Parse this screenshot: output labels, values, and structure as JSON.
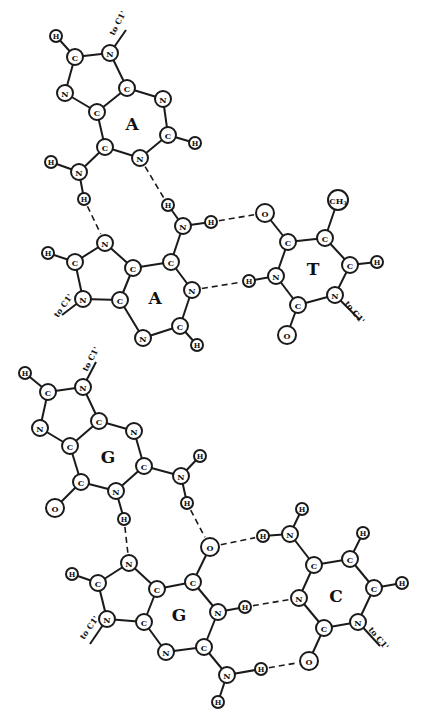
{
  "diagram": {
    "triples": [
      {
        "name": "A-A-T triple",
        "bases": [
          {
            "label": "A",
            "role": "hoogsteen-adenine"
          },
          {
            "label": "A",
            "role": "watson-crick-adenine"
          },
          {
            "label": "T",
            "role": "thymine"
          }
        ]
      },
      {
        "name": "G-G-C triple",
        "bases": [
          {
            "label": "G",
            "role": "hoogsteen-guanine"
          },
          {
            "label": "G",
            "role": "watson-crick-guanine"
          },
          {
            "label": "C",
            "role": "cytosine"
          }
        ]
      }
    ],
    "sugar_link_label": "to C1'",
    "atoms": [
      {
        "id": "a1_h8",
        "el": "H",
        "x": 56,
        "y": 36
      },
      {
        "id": "a1_c8",
        "el": "C",
        "x": 75,
        "y": 57
      },
      {
        "id": "a1_n9",
        "el": "N",
        "x": 110,
        "y": 53
      },
      {
        "id": "a1_n7",
        "el": "N",
        "x": 65,
        "y": 93
      },
      {
        "id": "a1_c5",
        "el": "C",
        "x": 97,
        "y": 112
      },
      {
        "id": "a1_c4",
        "el": "C",
        "x": 127,
        "y": 88
      },
      {
        "id": "a1_n3",
        "el": "N",
        "x": 163,
        "y": 99
      },
      {
        "id": "a1_c2",
        "el": "C",
        "x": 168,
        "y": 135
      },
      {
        "id": "a1_h2",
        "el": "H",
        "x": 195,
        "y": 143
      },
      {
        "id": "a1_c6",
        "el": "C",
        "x": 105,
        "y": 147
      },
      {
        "id": "a1_n1",
        "el": "N",
        "x": 140,
        "y": 158
      },
      {
        "id": "a1_n6",
        "el": "N",
        "x": 79,
        "y": 172
      },
      {
        "id": "a1_h6a",
        "el": "H",
        "x": 51,
        "y": 162
      },
      {
        "id": "a1_h6b",
        "el": "H",
        "x": 84,
        "y": 199
      },
      {
        "id": "a2_n7",
        "el": "N",
        "x": 105,
        "y": 243
      },
      {
        "id": "a2_c8",
        "el": "C",
        "x": 75,
        "y": 262
      },
      {
        "id": "a2_h8",
        "el": "H",
        "x": 48,
        "y": 253
      },
      {
        "id": "a2_n9",
        "el": "N",
        "x": 83,
        "y": 299
      },
      {
        "id": "a2_c4",
        "el": "C",
        "x": 120,
        "y": 300
      },
      {
        "id": "a2_c5",
        "el": "C",
        "x": 133,
        "y": 268
      },
      {
        "id": "a2_c6",
        "el": "C",
        "x": 171,
        "y": 262
      },
      {
        "id": "a2_n6",
        "el": "N",
        "x": 183,
        "y": 226
      },
      {
        "id": "a2_h6a",
        "el": "H",
        "x": 168,
        "y": 205
      },
      {
        "id": "a2_h6b",
        "el": "H",
        "x": 211,
        "y": 222
      },
      {
        "id": "a2_n1",
        "el": "N",
        "x": 192,
        "y": 290
      },
      {
        "id": "a2_c2",
        "el": "C",
        "x": 180,
        "y": 326
      },
      {
        "id": "a2_h2",
        "el": "H",
        "x": 197,
        "y": 345
      },
      {
        "id": "a2_n3",
        "el": "N",
        "x": 143,
        "y": 338
      },
      {
        "id": "t_o4",
        "el": "O",
        "x": 265,
        "y": 213
      },
      {
        "id": "t_c4",
        "el": "C",
        "x": 288,
        "y": 242
      },
      {
        "id": "t_c5",
        "el": "C",
        "x": 325,
        "y": 238
      },
      {
        "id": "t_ch3",
        "el": "CH3",
        "x": 338,
        "y": 200
      },
      {
        "id": "t_c6",
        "el": "C",
        "x": 350,
        "y": 265
      },
      {
        "id": "t_h6",
        "el": "H",
        "x": 377,
        "y": 262
      },
      {
        "id": "t_n1",
        "el": "N",
        "x": 335,
        "y": 295
      },
      {
        "id": "t_c2",
        "el": "C",
        "x": 298,
        "y": 305
      },
      {
        "id": "t_o2",
        "el": "O",
        "x": 287,
        "y": 335
      },
      {
        "id": "t_n3",
        "el": "N",
        "x": 276,
        "y": 276
      },
      {
        "id": "t_h3",
        "el": "H",
        "x": 249,
        "y": 281
      },
      {
        "id": "g1_h8",
        "el": "H",
        "x": 25,
        "y": 373
      },
      {
        "id": "g1_c8",
        "el": "C",
        "x": 48,
        "y": 392
      },
      {
        "id": "g1_n9",
        "el": "N",
        "x": 83,
        "y": 387
      },
      {
        "id": "g1_n7",
        "el": "N",
        "x": 40,
        "y": 428
      },
      {
        "id": "g1_c5",
        "el": "C",
        "x": 70,
        "y": 446
      },
      {
        "id": "g1_c4",
        "el": "C",
        "x": 99,
        "y": 421
      },
      {
        "id": "g1_n3",
        "el": "N",
        "x": 134,
        "y": 431
      },
      {
        "id": "g1_c2",
        "el": "C",
        "x": 144,
        "y": 466
      },
      {
        "id": "g1_n2",
        "el": "N",
        "x": 181,
        "y": 476
      },
      {
        "id": "g1_h2a",
        "el": "H",
        "x": 200,
        "y": 456
      },
      {
        "id": "g1_h2b",
        "el": "H",
        "x": 187,
        "y": 503
      },
      {
        "id": "g1_n1",
        "el": "N",
        "x": 116,
        "y": 491
      },
      {
        "id": "g1_h1",
        "el": "H",
        "x": 124,
        "y": 519
      },
      {
        "id": "g1_c6",
        "el": "C",
        "x": 81,
        "y": 482
      },
      {
        "id": "g1_o6",
        "el": "O",
        "x": 55,
        "y": 508
      },
      {
        "id": "g2_n7",
        "el": "N",
        "x": 129,
        "y": 563
      },
      {
        "id": "g2_c8",
        "el": "C",
        "x": 98,
        "y": 583
      },
      {
        "id": "g2_h8",
        "el": "H",
        "x": 72,
        "y": 574
      },
      {
        "id": "g2_n9",
        "el": "N",
        "x": 107,
        "y": 619
      },
      {
        "id": "g2_c4",
        "el": "C",
        "x": 144,
        "y": 622
      },
      {
        "id": "g2_c5",
        "el": "C",
        "x": 157,
        "y": 589
      },
      {
        "id": "g2_c6",
        "el": "C",
        "x": 193,
        "y": 582
      },
      {
        "id": "g2_o6",
        "el": "O",
        "x": 210,
        "y": 547
      },
      {
        "id": "g2_n1",
        "el": "N",
        "x": 218,
        "y": 612
      },
      {
        "id": "g2_h1",
        "el": "H",
        "x": 245,
        "y": 607
      },
      {
        "id": "g2_c2",
        "el": "C",
        "x": 204,
        "y": 647
      },
      {
        "id": "g2_n2",
        "el": "N",
        "x": 227,
        "y": 675
      },
      {
        "id": "g2_h2a",
        "el": "H",
        "x": 261,
        "y": 669
      },
      {
        "id": "g2_h2b",
        "el": "H",
        "x": 218,
        "y": 702
      },
      {
        "id": "g2_n3",
        "el": "N",
        "x": 166,
        "y": 652
      },
      {
        "id": "c_n4",
        "el": "N",
        "x": 290,
        "y": 534
      },
      {
        "id": "c_h4a",
        "el": "H",
        "x": 302,
        "y": 509
      },
      {
        "id": "c_h4b",
        "el": "H",
        "x": 263,
        "y": 536
      },
      {
        "id": "c_c4",
        "el": "C",
        "x": 314,
        "y": 565
      },
      {
        "id": "c_c5",
        "el": "C",
        "x": 350,
        "y": 559
      },
      {
        "id": "c_h5",
        "el": "H",
        "x": 363,
        "y": 533
      },
      {
        "id": "c_c6",
        "el": "C",
        "x": 374,
        "y": 588
      },
      {
        "id": "c_h6",
        "el": "H",
        "x": 402,
        "y": 583
      },
      {
        "id": "c_n1",
        "el": "N",
        "x": 358,
        "y": 622
      },
      {
        "id": "c_c2",
        "el": "C",
        "x": 324,
        "y": 628
      },
      {
        "id": "c_o2",
        "el": "O",
        "x": 309,
        "y": 661
      },
      {
        "id": "c_n3",
        "el": "N",
        "x": 299,
        "y": 598
      }
    ],
    "bonds": [
      [
        "a1_h8",
        "a1_c8"
      ],
      [
        "a1_c8",
        "a1_n9"
      ],
      [
        "a1_c8",
        "a1_n7"
      ],
      [
        "a1_n9",
        "a1_c4"
      ],
      [
        "a1_n7",
        "a1_c5"
      ],
      [
        "a1_c5",
        "a1_c4"
      ],
      [
        "a1_c4",
        "a1_n3"
      ],
      [
        "a1_n3",
        "a1_c2"
      ],
      [
        "a1_c2",
        "a1_h2"
      ],
      [
        "a1_c2",
        "a1_n1"
      ],
      [
        "a1_n1",
        "a1_c6"
      ],
      [
        "a1_c6",
        "a1_c5"
      ],
      [
        "a1_c6",
        "a1_n6"
      ],
      [
        "a1_n6",
        "a1_h6a"
      ],
      [
        "a1_n6",
        "a1_h6b"
      ],
      [
        "a2_n7",
        "a2_c8"
      ],
      [
        "a2_c8",
        "a2_h8"
      ],
      [
        "a2_c8",
        "a2_n9"
      ],
      [
        "a2_n9",
        "a2_c4"
      ],
      [
        "a2_c4",
        "a2_c5"
      ],
      [
        "a2_c5",
        "a2_n7"
      ],
      [
        "a2_c5",
        "a2_c6"
      ],
      [
        "a2_c6",
        "a2_n6"
      ],
      [
        "a2_n6",
        "a2_h6a"
      ],
      [
        "a2_n6",
        "a2_h6b"
      ],
      [
        "a2_c6",
        "a2_n1"
      ],
      [
        "a2_n1",
        "a2_c2"
      ],
      [
        "a2_c2",
        "a2_h2"
      ],
      [
        "a2_c2",
        "a2_n3"
      ],
      [
        "a2_n3",
        "a2_c4"
      ],
      [
        "t_o4",
        "t_c4"
      ],
      [
        "t_c4",
        "t_c5"
      ],
      [
        "t_c5",
        "t_ch3"
      ],
      [
        "t_c5",
        "t_c6"
      ],
      [
        "t_c6",
        "t_h6"
      ],
      [
        "t_c6",
        "t_n1"
      ],
      [
        "t_n1",
        "t_c2"
      ],
      [
        "t_c2",
        "t_o2"
      ],
      [
        "t_c2",
        "t_n3"
      ],
      [
        "t_n3",
        "t_c4"
      ],
      [
        "t_n3",
        "t_h3"
      ],
      [
        "g1_h8",
        "g1_c8"
      ],
      [
        "g1_c8",
        "g1_n9"
      ],
      [
        "g1_c8",
        "g1_n7"
      ],
      [
        "g1_n9",
        "g1_c4"
      ],
      [
        "g1_n7",
        "g1_c5"
      ],
      [
        "g1_c5",
        "g1_c4"
      ],
      [
        "g1_c4",
        "g1_n3"
      ],
      [
        "g1_n3",
        "g1_c2"
      ],
      [
        "g1_c2",
        "g1_n2"
      ],
      [
        "g1_n2",
        "g1_h2a"
      ],
      [
        "g1_n2",
        "g1_h2b"
      ],
      [
        "g1_c2",
        "g1_n1"
      ],
      [
        "g1_n1",
        "g1_h1"
      ],
      [
        "g1_n1",
        "g1_c6"
      ],
      [
        "g1_c6",
        "g1_c5"
      ],
      [
        "g1_c6",
        "g1_o6"
      ],
      [
        "g2_n7",
        "g2_c8"
      ],
      [
        "g2_c8",
        "g2_h8"
      ],
      [
        "g2_c8",
        "g2_n9"
      ],
      [
        "g2_n9",
        "g2_c4"
      ],
      [
        "g2_c4",
        "g2_c5"
      ],
      [
        "g2_c5",
        "g2_n7"
      ],
      [
        "g2_c5",
        "g2_c6"
      ],
      [
        "g2_c6",
        "g2_o6"
      ],
      [
        "g2_c6",
        "g2_n1"
      ],
      [
        "g2_n1",
        "g2_h1"
      ],
      [
        "g2_n1",
        "g2_c2"
      ],
      [
        "g2_c2",
        "g2_n2"
      ],
      [
        "g2_n2",
        "g2_h2a"
      ],
      [
        "g2_n2",
        "g2_h2b"
      ],
      [
        "g2_c2",
        "g2_n3"
      ],
      [
        "g2_n3",
        "g2_c4"
      ],
      [
        "c_n4",
        "c_h4a"
      ],
      [
        "c_n4",
        "c_h4b"
      ],
      [
        "c_n4",
        "c_c4"
      ],
      [
        "c_c4",
        "c_c5"
      ],
      [
        "c_c5",
        "c_h5"
      ],
      [
        "c_c5",
        "c_c6"
      ],
      [
        "c_c6",
        "c_h6"
      ],
      [
        "c_c6",
        "c_n1"
      ],
      [
        "c_n1",
        "c_c2"
      ],
      [
        "c_c2",
        "c_o2"
      ],
      [
        "c_c2",
        "c_n3"
      ],
      [
        "c_n3",
        "c_c4"
      ]
    ],
    "hbonds": [
      [
        "a1_n1",
        "a2_h6a"
      ],
      [
        "a1_h6b",
        "a2_n7"
      ],
      [
        "a2_h6b",
        "t_o4"
      ],
      [
        "a2_n1",
        "t_h3"
      ],
      [
        "g1_h2b",
        "g2_o6"
      ],
      [
        "g1_h1",
        "g2_n7"
      ],
      [
        "g2_o6",
        "c_h4b"
      ],
      [
        "g2_h1",
        "c_n3"
      ],
      [
        "g2_h2a",
        "c_o2"
      ]
    ],
    "sugar_links": [
      {
        "from": "a1_n9",
        "x2": 126,
        "y2": 30,
        "lx": 114,
        "ly": 36,
        "rot": -62
      },
      {
        "from": "a2_n9",
        "x2": 62,
        "y2": 315,
        "lx": 58,
        "ly": 318,
        "rot": -55
      },
      {
        "from": "t_n1",
        "x2": 360,
        "y2": 320,
        "lx": 344,
        "ly": 304,
        "rot": 50
      },
      {
        "from": "g1_n9",
        "x2": 96,
        "y2": 362,
        "lx": 87,
        "ly": 372,
        "rot": -62
      },
      {
        "from": "g2_n9",
        "x2": 90,
        "y2": 644,
        "lx": 84,
        "ly": 640,
        "rot": -55
      },
      {
        "from": "c_n1",
        "x2": 380,
        "y2": 646,
        "lx": 368,
        "ly": 630,
        "rot": 50
      }
    ],
    "base_labels": [
      {
        "text": "A",
        "x": 132,
        "y": 124
      },
      {
        "text": "A",
        "x": 155,
        "y": 298
      },
      {
        "text": "T",
        "x": 313,
        "y": 269
      },
      {
        "text": "G",
        "x": 108,
        "y": 457
      },
      {
        "text": "G",
        "x": 179,
        "y": 615
      },
      {
        "text": "C",
        "x": 336,
        "y": 596
      }
    ]
  }
}
